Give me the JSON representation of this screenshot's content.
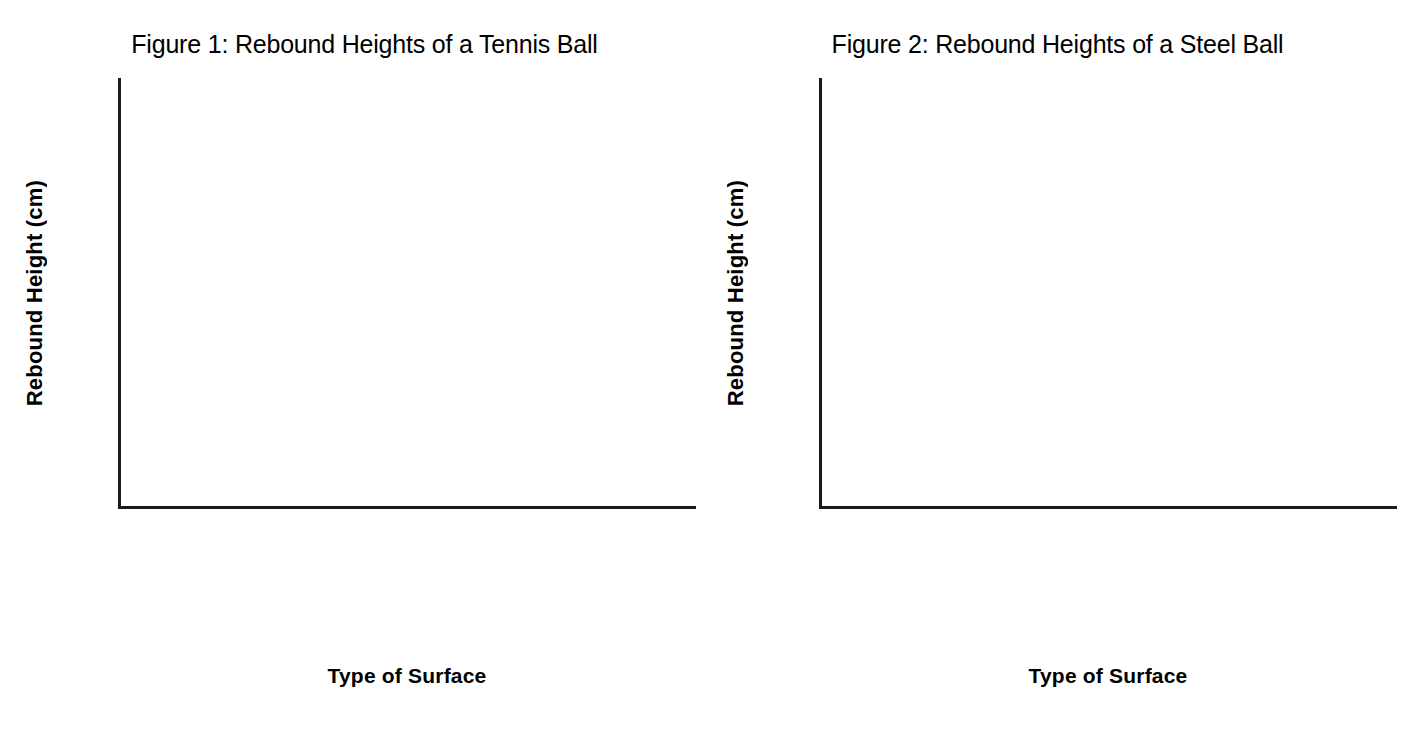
{
  "chart_data": [
    {
      "type": "bar",
      "title": "Figure 1: Rebound Heights of a Tennis Ball",
      "categories": [
        "Carpet",
        "Tile",
        "Soft Foam",
        "Aluminum",
        "Cardboard"
      ],
      "values": [
        67,
        92,
        36.7,
        94.5,
        87.5
      ],
      "xlabel": "Type of Surface",
      "ylabel": "Rebound Height (cm)",
      "ylim": [
        0,
        100
      ],
      "ytick_step": 10,
      "yticks": [
        0,
        10,
        20,
        30,
        40,
        50,
        60,
        70,
        80,
        90,
        100
      ],
      "ytick_labels": [
        "0",
        "10",
        "20",
        "30",
        "40",
        "50",
        "60",
        "70",
        "80",
        "90",
        "100"
      ],
      "grid": false,
      "legend": false,
      "bar_fill": "hatched-diagonal",
      "bar_edge_color": "#2a2a2a",
      "hatch_color": "#555555",
      "background": "#ffffff"
    },
    {
      "type": "bar",
      "title": "Figure 2: Rebound Heights of a Steel Ball",
      "categories": [
        "Carpet",
        "Tile",
        "Soft Foam",
        "Aluminum",
        "Cardboard"
      ],
      "values": [
        14,
        16,
        52,
        4,
        18.8
      ],
      "xlabel": "Type of Surface",
      "ylabel": "Rebound Height (cm)",
      "ylim": [
        0,
        60
      ],
      "ytick_step": 10,
      "yticks": [
        0,
        10,
        20,
        30,
        40,
        50,
        60
      ],
      "ytick_labels": [
        "0",
        "10",
        "20",
        "30",
        "40",
        "50",
        "60"
      ],
      "grid": false,
      "legend": false,
      "bar_fill": "hatched-diagonal",
      "bar_edge_color": "#2a2a2a",
      "hatch_color": "#555555",
      "background": "#ffffff"
    }
  ]
}
